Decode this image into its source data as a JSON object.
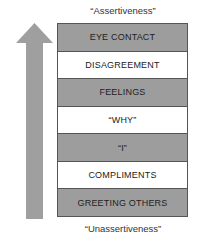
{
  "diagram": {
    "top_label": "“Assertiveness”",
    "bottom_label": "“Unassertiveness”",
    "arrow": {
      "direction": "up",
      "color": "#9f9f9f"
    },
    "rungs": [
      {
        "label": "EYE CONTACT",
        "shade": "dark"
      },
      {
        "label": "DISAGREEMENT",
        "shade": "light"
      },
      {
        "label": "FEELINGS",
        "shade": "dark"
      },
      {
        "label": "“WHY”",
        "shade": "light"
      },
      {
        "label": "“I”",
        "shade": "dark"
      },
      {
        "label": "COMPLIMENTS",
        "shade": "light"
      },
      {
        "label": "GREETING OTHERS",
        "shade": "dark"
      }
    ],
    "colors": {
      "dark_rung": "#9d9d9d",
      "light_rung": "#ffffff",
      "border": "#555555"
    }
  }
}
